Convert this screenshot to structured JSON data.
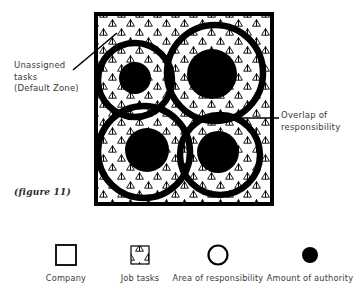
{
  "figure": {
    "caption": "(figure 11)",
    "annotations": [
      {
        "name": "unassigned-tasks",
        "lines": [
          "Unassigned",
          "tasks",
          "(Default Zone)"
        ]
      },
      {
        "name": "overlap-of-responsibility",
        "lines": [
          "Overlap of",
          "responsibility"
        ]
      }
    ]
  },
  "diagram": {
    "company_box": {
      "x": 96,
      "y": 14,
      "width": 176,
      "height": 190,
      "stroke": "#000000",
      "stroke_width": 4,
      "fill": "#ffffff"
    },
    "pattern": {
      "name": "triangle-hatch",
      "shape": "triangle-outline",
      "stroke": "#000000"
    },
    "responsibility_circles": [
      {
        "name": "responsibility-circle-top-left",
        "cx": 135,
        "cy": 80,
        "r": 37
      },
      {
        "name": "responsibility-circle-top-right",
        "cx": 215,
        "cy": 73,
        "r": 48
      },
      {
        "name": "responsibility-circle-bottom-left",
        "cx": 144,
        "cy": 152,
        "r": 46
      },
      {
        "name": "responsibility-circle-bottom-right",
        "cx": 220,
        "cy": 155,
        "r": 40
      }
    ],
    "authority_dots": [
      {
        "name": "authority-dot-top-left",
        "cx": 135,
        "cy": 78,
        "r": 16
      },
      {
        "name": "authority-dot-top-right",
        "cx": 212,
        "cy": 74,
        "r": 25
      },
      {
        "name": "authority-dot-bottom-left",
        "cx": 147,
        "cy": 150,
        "r": 22
      },
      {
        "name": "authority-dot-bottom-right",
        "cx": 218,
        "cy": 152,
        "r": 21
      }
    ],
    "leader_lines": [
      {
        "name": "leader-line-unassigned-tasks",
        "x1": 73,
        "y1": 70,
        "x2": 117,
        "y2": 33
      },
      {
        "name": "leader-line-overlap",
        "x1": 212,
        "y1": 118,
        "x2": 279,
        "y2": 118
      }
    ]
  },
  "legend": {
    "items": [
      {
        "label": "Company",
        "icon": "square-outline-icon",
        "center_x": 66
      },
      {
        "label": "Job tasks",
        "icon": "triangle-pattern-icon",
        "center_x": 140
      },
      {
        "label": "Area of responsibility",
        "icon": "circle-outline-icon",
        "center_x": 218
      },
      {
        "label": "Amount of authority",
        "icon": "filled-circle-icon",
        "center_x": 310
      }
    ]
  },
  "colors": {
    "ink": "#000000",
    "text": "#3a3a3a",
    "paper": "#ffffff"
  }
}
